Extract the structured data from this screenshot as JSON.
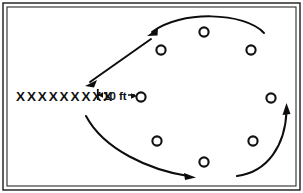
{
  "diagram": {
    "background_color": "#ffffff",
    "ink_color": "#111111",
    "frame": {
      "name": "border-frame",
      "outer": {
        "x": 3,
        "y": 3,
        "width": 297,
        "height": 187
      },
      "inner": {
        "x": 7,
        "y": 7,
        "width": 289,
        "height": 179
      }
    },
    "x_row": {
      "label": "XXXXXXXXX",
      "count": 9,
      "x": 16,
      "y": 101
    },
    "dimension": {
      "label": "10 ft",
      "label_x": 103,
      "label_y": 100,
      "tick_x": 97,
      "tick_y_top": 89,
      "tick_y_bottom": 100,
      "line_y": 95,
      "line_x_start": 97,
      "line_x_end": 135,
      "arrow_target_x": 136
    },
    "circles": [
      {
        "name": "player-circle-top-center",
        "cx": 204,
        "cy": 32,
        "r": 4.6
      },
      {
        "name": "player-circle-upper-left",
        "cx": 161,
        "cy": 50,
        "r": 4.6
      },
      {
        "name": "player-circle-upper-right",
        "cx": 251,
        "cy": 50,
        "r": 4.6
      },
      {
        "name": "player-circle-right",
        "cx": 271,
        "cy": 98,
        "r": 4.6
      },
      {
        "name": "player-circle-lower-left",
        "cx": 157,
        "cy": 141,
        "r": 4.6
      },
      {
        "name": "player-circle-bottom-center",
        "cx": 204,
        "cy": 162,
        "r": 4.6
      },
      {
        "name": "player-circle-lower-right",
        "cx": 253,
        "cy": 141,
        "r": 4.6
      },
      {
        "name": "player-circle-dimension-end",
        "cx": 141,
        "cy": 97,
        "r": 4.6
      }
    ],
    "arrows": [
      {
        "name": "motion-arrow-top-arc",
        "kind": "arc",
        "path": "M 264 33 C 245 12 180 10 152 32",
        "head_x": 150,
        "head_y": 33,
        "head_angle": 218
      },
      {
        "name": "motion-arrow-diagonal",
        "kind": "line",
        "x1": 150,
        "y1": 39,
        "x2": 88,
        "y2": 83,
        "head_x": 87,
        "head_y": 84,
        "head_angle": 215
      },
      {
        "name": "motion-arrow-bottom-arc",
        "kind": "arc",
        "path": "M 86 116 C 104 150 150 170 190 176",
        "head_x": 194,
        "head_y": 177,
        "head_angle": 12
      },
      {
        "name": "motion-arrow-right-arc",
        "kind": "arc",
        "path": "M 237 176 C 268 172 285 143 287 110",
        "head_x": 287,
        "head_y": 105,
        "head_angle": 273
      }
    ]
  }
}
